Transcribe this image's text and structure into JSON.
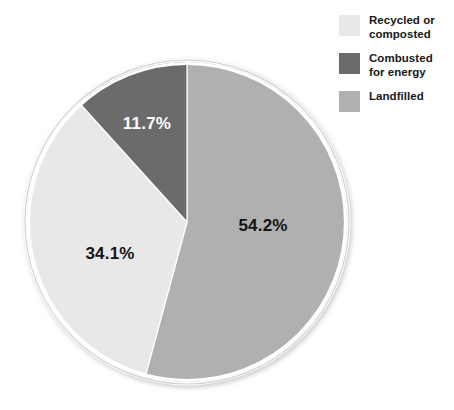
{
  "chart_data": {
    "type": "pie",
    "title": "",
    "subtitle": "",
    "xlabel": "",
    "ylabel": "",
    "grid": false,
    "legend_position": "top-right",
    "start_angle_deg": 0,
    "direction": "clockwise",
    "categories": [
      "Landfilled",
      "Recycled or composted",
      "Combusted for energy"
    ],
    "values": [
      54.2,
      34.1,
      11.7
    ],
    "unit": "%",
    "slices": [
      {
        "name": "Landfilled",
        "value": 54.2,
        "label": "54.2%",
        "color": "#b0b0b0",
        "label_color": "#141414",
        "legend_label_line1": "Landfilled",
        "legend_label_line2": ""
      },
      {
        "name": "Recycled or composted",
        "value": 34.1,
        "label": "34.1%",
        "color": "#e8e8e8",
        "label_color": "#141414",
        "legend_label_line1": "Recycled or",
        "legend_label_line2": "composted"
      },
      {
        "name": "Combusted for energy",
        "value": 11.7,
        "label": "11.7%",
        "color": "#6b6b6b",
        "label_color": "#ffffff",
        "legend_label_line1": "Combusted",
        "legend_label_line2": "for energy"
      }
    ]
  },
  "legend": {
    "items": [
      {
        "label": "Recycled or composted",
        "line1": "Recycled or",
        "line2": "composted",
        "color": "#e8e8e8"
      },
      {
        "label": "Combusted for energy",
        "line1": "Combusted",
        "line2": "for energy",
        "color": "#6b6b6b"
      },
      {
        "label": "Landfilled",
        "line1": "Landfilled",
        "line2": "",
        "color": "#b0b0b0"
      }
    ]
  },
  "colors": {
    "background": "#ffffff",
    "slice_light": "#e8e8e8",
    "slice_dark": "#6b6b6b",
    "slice_medium": "#b0b0b0",
    "pie_outline": "#ffffff",
    "text": "#171717",
    "label_light": "#ffffff"
  }
}
